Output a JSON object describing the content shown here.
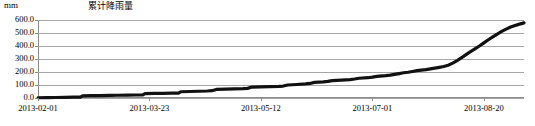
{
  "chart": {
    "unit_label": "mm",
    "title": "累计降雨量"
  },
  "chart_data": {
    "type": "line",
    "title": "累计降雨量",
    "xlabel": "",
    "ylabel": "mm",
    "grid": true,
    "legend": false,
    "ylim": [
      0,
      600
    ],
    "ytick_labels": [
      "600.0",
      "500.0",
      "400.0",
      "300.0",
      "200.0",
      "100.0",
      "0.0"
    ],
    "ytick_values": [
      600,
      500,
      400,
      300,
      200,
      100,
      0
    ],
    "xtick_labels": [
      "2013-02-01",
      "2013-03-23",
      "2013-05-12",
      "2013-07-01",
      "2013-08-20"
    ],
    "xtick_positions": [
      0,
      50,
      100,
      150,
      200
    ],
    "xlim": [
      0,
      218
    ],
    "series": [
      {
        "name": "累计降雨量",
        "color": "#111111",
        "x": [
          0,
          4,
          8,
          12,
          16,
          19,
          20,
          24,
          28,
          32,
          36,
          40,
          44,
          47,
          48,
          52,
          56,
          60,
          63,
          64,
          68,
          72,
          76,
          78,
          80,
          84,
          88,
          92,
          94,
          96,
          100,
          104,
          108,
          110,
          112,
          116,
          120,
          122,
          124,
          128,
          130,
          132,
          136,
          140,
          142,
          144,
          148,
          150,
          152,
          156,
          158,
          160,
          162,
          164,
          166,
          168,
          170,
          172,
          174,
          176,
          178,
          180,
          182,
          184,
          186,
          188,
          190,
          192,
          194,
          196,
          198,
          200,
          202,
          204,
          206,
          208,
          210,
          212,
          214,
          216,
          218
        ],
        "values": [
          2,
          3,
          4,
          5,
          6,
          7,
          17,
          18,
          19,
          20,
          21,
          22,
          23,
          24,
          34,
          35,
          36,
          37,
          38,
          48,
          50,
          52,
          54,
          56,
          66,
          68,
          70,
          72,
          74,
          84,
          86,
          88,
          90,
          92,
          100,
          104,
          108,
          112,
          120,
          124,
          128,
          134,
          138,
          142,
          146,
          152,
          156,
          160,
          166,
          172,
          176,
          182,
          188,
          194,
          198,
          204,
          210,
          214,
          218,
          224,
          230,
          236,
          242,
          252,
          268,
          288,
          310,
          334,
          356,
          378,
          400,
          424,
          448,
          470,
          492,
          512,
          530,
          546,
          558,
          568,
          578
        ]
      }
    ]
  }
}
